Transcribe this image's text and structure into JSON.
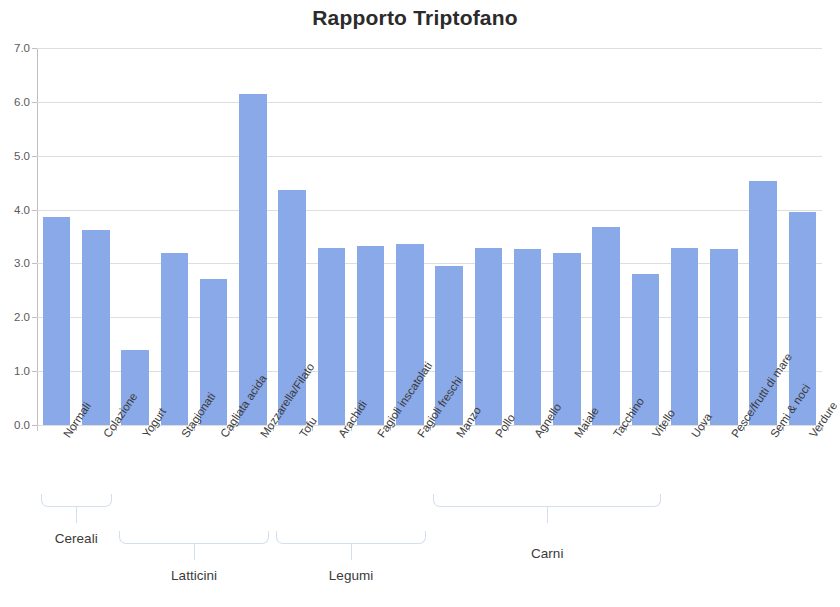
{
  "chart_data": {
    "type": "bar",
    "title": "Rapporto Triptofano",
    "xlabel": "",
    "ylabel": "",
    "ylim": [
      0.0,
      7.0
    ],
    "ytick_labels": [
      "0.0",
      "1.0",
      "2.0",
      "3.0",
      "4.0",
      "5.0",
      "6.0",
      "7.0"
    ],
    "ytick_values": [
      0.0,
      1.0,
      2.0,
      3.0,
      4.0,
      5.0,
      6.0,
      7.0
    ],
    "grid": true,
    "legend": null,
    "bar_color": "#8aa9e8",
    "categories": [
      "Normali",
      "Colazione",
      "Yogurt",
      "Stagionati",
      "Cagliata acida",
      "Mozzarella/Filato",
      "Tofu",
      "Arachidi",
      "Fagioli inscatolati",
      "Fagioli freschi",
      "Manzo",
      "Pollo",
      "Agnello",
      "Maiale",
      "Tacchino",
      "Vitello",
      "Uova",
      "Pesce/frutti di mare",
      "Semi & noci",
      "Verdure"
    ],
    "values": [
      3.86,
      3.63,
      1.4,
      3.19,
      2.72,
      6.15,
      4.37,
      3.28,
      3.33,
      3.36,
      2.96,
      3.29,
      3.27,
      3.2,
      3.67,
      2.81,
      3.28,
      3.26,
      4.53,
      3.96
    ],
    "groups": [
      {
        "label": "Cereali",
        "first": 0,
        "last": 1
      },
      {
        "label": "Latticini",
        "first": 2,
        "last": 5
      },
      {
        "label": "Legumi",
        "first": 6,
        "last": 9
      },
      {
        "label": "Carni",
        "first": 10,
        "last": 15
      }
    ]
  }
}
